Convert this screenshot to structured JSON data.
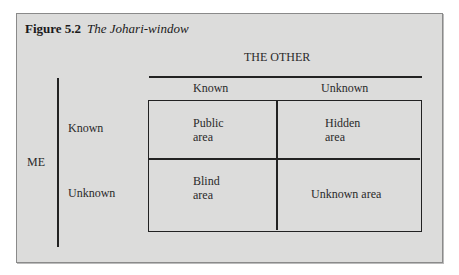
{
  "figure": {
    "label": "Figure 5.2",
    "caption": "The Johari-window"
  },
  "axes": {
    "top_heading": "THE OTHER",
    "left_heading": "ME",
    "columns": [
      "Known",
      "Unknown"
    ],
    "rows": [
      "Known",
      "Unknown"
    ]
  },
  "quadrants": {
    "top_left": {
      "line1": "Public",
      "line2": "area"
    },
    "top_right": {
      "line1": "Hidden",
      "line2": "area"
    },
    "bottom_left": {
      "line1": "Blind",
      "line2": "area"
    },
    "bottom_right": {
      "line1": "Unknown area"
    }
  },
  "colors": {
    "panel_background": "#dcdcdb",
    "line": "#222222"
  }
}
